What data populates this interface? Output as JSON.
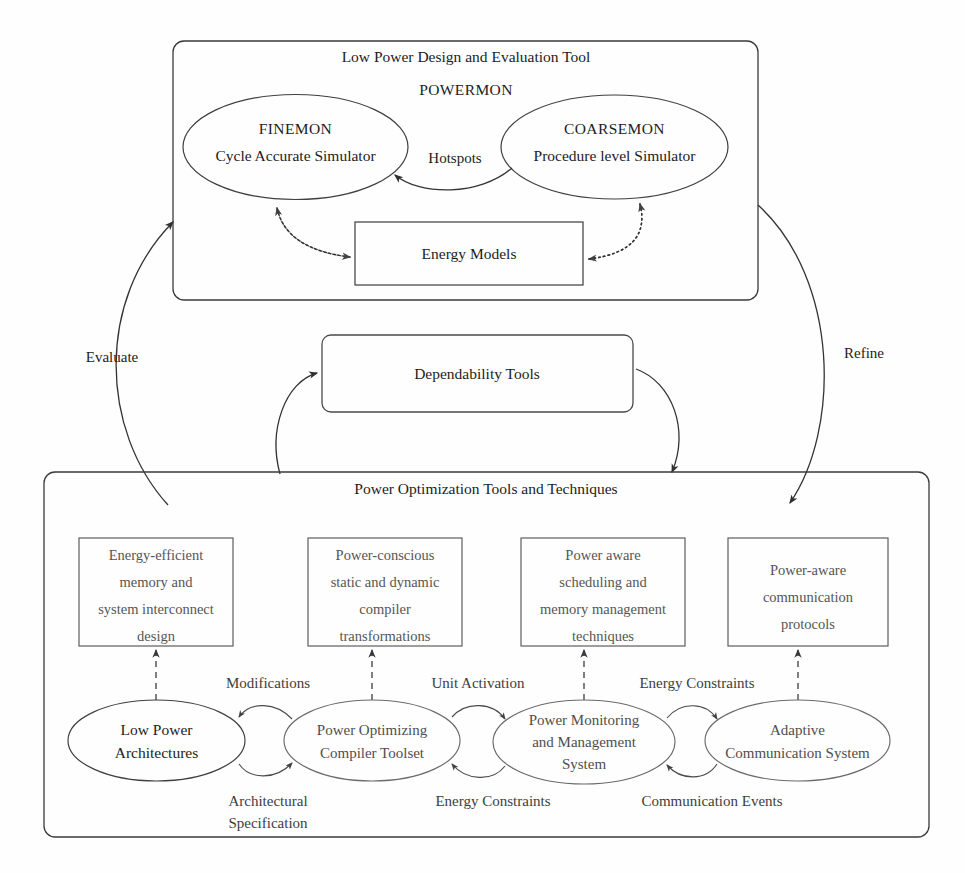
{
  "figure": {
    "background_color": "#fefefe",
    "ink_color": "#1c1c1c"
  },
  "top_panel": {
    "title": "Low Power Design and Evaluation Tool",
    "subtitle": "POWERMON",
    "finemon": {
      "name": "FINEMON",
      "description": "Cycle Accurate Simulator"
    },
    "coarsemon": {
      "name": "COARSEMON",
      "description": "Procedure level Simulator"
    },
    "energy_models": {
      "label": "Energy Models"
    },
    "edges": {
      "hotspots": "Hotspots"
    }
  },
  "middle": {
    "dependability_tools": {
      "label": "Dependability Tools"
    },
    "outer_loop": {
      "evaluate": "Evaluate",
      "refine": "Refine"
    }
  },
  "bottom_panel": {
    "title": "Power Optimization Tools and Techniques",
    "technique_boxes": [
      {
        "id": "energy-efficient-memory",
        "lines": [
          "Energy-efficient",
          "memory and",
          "system interconnect",
          "design"
        ]
      },
      {
        "id": "power-conscious-compiler",
        "lines": [
          "Power-conscious",
          "static and dynamic",
          "compiler",
          "transformations"
        ]
      },
      {
        "id": "power-aware-scheduling",
        "lines": [
          "Power aware",
          "scheduling and",
          "memory management",
          "techniques"
        ]
      },
      {
        "id": "power-aware-communication",
        "lines": [
          "Power-aware",
          "communication",
          "protocols"
        ]
      }
    ],
    "component_ellipses": [
      {
        "id": "low-power-architectures",
        "lines": [
          "Low Power",
          "Architectures"
        ]
      },
      {
        "id": "power-optimizing-compiler-toolset",
        "lines": [
          "Power Optimizing",
          "Compiler Toolset"
        ]
      },
      {
        "id": "power-monitoring-management-system",
        "lines": [
          "Power Monitoring",
          "and Management",
          "System"
        ]
      },
      {
        "id": "adaptive-communication-system",
        "lines": [
          "Adaptive",
          "Communication System"
        ]
      }
    ],
    "edge_labels": {
      "modifications": "Modifications",
      "architectural_specification_line1": "Architectural",
      "architectural_specification_line2": "Specification",
      "unit_activation": "Unit Activation",
      "energy_constraints_lower": "Energy Constraints",
      "energy_constraints_upper": "Energy Constraints",
      "communication_events": "Communication Events"
    }
  }
}
